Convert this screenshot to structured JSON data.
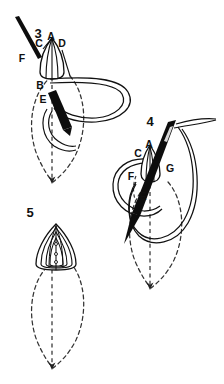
{
  "figure": {
    "background_color": "#ffffff",
    "ink_color": "#111111",
    "needle_fill": "#0d0d0d",
    "thread_stroke": "#111111",
    "dashed_stroke": "#333333"
  },
  "steps": [
    {
      "id": "step-3",
      "number": "3",
      "number_pos": {
        "x": 38,
        "y": 38
      },
      "labels": [
        {
          "text": "A",
          "x": 51,
          "y": 40
        },
        {
          "text": "C",
          "x": 39,
          "y": 47
        },
        {
          "text": "D",
          "x": 62,
          "y": 47
        },
        {
          "text": "F",
          "x": 22,
          "y": 62
        },
        {
          "text": "B",
          "x": 40,
          "y": 89
        },
        {
          "text": "E",
          "x": 43,
          "y": 103
        }
      ]
    },
    {
      "id": "step-4",
      "number": "4",
      "number_pos": {
        "x": 150,
        "y": 126
      },
      "labels": [
        {
          "text": "A",
          "x": 149,
          "y": 148
        },
        {
          "text": "C",
          "x": 138,
          "y": 157
        },
        {
          "text": "G",
          "x": 170,
          "y": 172
        },
        {
          "text": "F",
          "x": 131,
          "y": 180
        },
        {
          "text": "E",
          "x": 143,
          "y": 200
        }
      ]
    },
    {
      "id": "step-5",
      "number": "5",
      "number_pos": {
        "x": 30,
        "y": 217
      },
      "labels": []
    }
  ],
  "legend": {
    "element_names": [
      "needle",
      "thread-loop",
      "dashed-petal-outline",
      "filled-petal",
      "direction-arrow"
    ]
  }
}
